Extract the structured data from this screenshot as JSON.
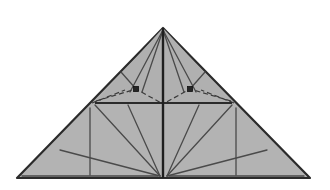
{
  "figure": {
    "type": "origami-crease-pattern",
    "canvas": {
      "width": 330,
      "height": 190,
      "background": "#ffffff"
    },
    "colors": {
      "paper_fill": "#b3b3b3",
      "paper_fill_upper": "#b0b0b0",
      "outline": "#2b2b2b",
      "crease_solid": "#4a4a4a",
      "crease_dashed": "#3a3a3a",
      "spine": "#1f1f1f",
      "marker_fill": "#262626",
      "marker_stroke": "#111111"
    },
    "stroke_widths": {
      "outline": 2.2,
      "spine": 2.4,
      "crease_solid": 1.3,
      "crease_heavy": 1.9,
      "crease_dashed": 1.2
    },
    "dash_pattern": "5,3"
  },
  "vertices": {
    "apex": {
      "x": 163,
      "y": 28,
      "label": "apex"
    },
    "bottom_left": {
      "x": 17,
      "y": 178,
      "label": "bottom-left-corner"
    },
    "bottom_right": {
      "x": 310,
      "y": 178,
      "label": "bottom-right-corner"
    },
    "center_bottom": {
      "x": 163,
      "y": 178,
      "label": "center-bottom"
    },
    "band_left": {
      "x": 95,
      "y": 103,
      "label": "horizontal-band-left-end"
    },
    "band_right": {
      "x": 232,
      "y": 103,
      "label": "horizontal-band-right-end"
    },
    "marker_left": {
      "x": 136,
      "y": 89,
      "label": "left-pleat-node"
    },
    "marker_right": {
      "x": 190,
      "y": 89,
      "label": "right-pleat-node"
    },
    "left_vertical_top": {
      "x": 90,
      "y": 108,
      "label": "left-vertical-crease-top"
    },
    "left_vertical_bottom": {
      "x": 90,
      "y": 175,
      "label": "left-vertical-crease-bottom"
    },
    "right_vertical_top": {
      "x": 236,
      "y": 108,
      "label": "right-vertical-crease-top"
    },
    "right_vertical_bottom": {
      "x": 236,
      "y": 175,
      "label": "right-vertical-crease-bottom"
    }
  },
  "shapes": {
    "paper_outline": "17,178 163,28 310,178",
    "upper_left_panel": "163,28 95,103 163,103",
    "upper_right_panel": "163,28 232,103 163,103"
  },
  "creases": {
    "spine": {
      "name": "center-vertical-spine",
      "d": "M 163,28 L 163,178",
      "style": "heavy-solid"
    },
    "horizontal_band": {
      "name": "horizontal-fold-band",
      "d": "M 95,103 L 232,103",
      "style": "heavy-solid"
    },
    "apex_rays": [
      {
        "name": "apex-ray-left-outer",
        "d": "M 163,30 L 130,92"
      },
      {
        "name": "apex-ray-left-inner",
        "d": "M 163,30 L 142,92"
      },
      {
        "name": "apex-ray-right-inner",
        "d": "M 163,30 L 184,92"
      },
      {
        "name": "apex-ray-right-outer",
        "d": "M 163,30 L 196,92"
      }
    ],
    "dashed_arcs": [
      {
        "name": "dashed-arc-left",
        "d": "M 96,101 L 136,89 L 163,104"
      },
      {
        "name": "dashed-arc-right",
        "d": "M 231,101 L 190,89 L 163,104"
      },
      {
        "name": "dashed-sweep-left",
        "d": "M 92,103 L 125,90"
      },
      {
        "name": "dashed-sweep-right",
        "d": "M 234,103 L 201,90"
      }
    ],
    "corner_creases": [
      {
        "name": "upper-left-corner-crease",
        "d": "M 121,72 L 136,89"
      },
      {
        "name": "upper-right-corner-crease",
        "d": "M 205,72 L 190,89"
      }
    ],
    "lower_left_fan": [
      {
        "name": "fan-left-ray-1",
        "d": "M 160,176 L 95,105"
      },
      {
        "name": "fan-left-ray-2",
        "d": "M 160,176 L 128,105"
      },
      {
        "name": "fan-left-ray-3",
        "d": "M 160,176 L 60,150"
      },
      {
        "name": "fan-left-ray-4",
        "d": "M 158,176 L 22,176"
      }
    ],
    "lower_right_fan": [
      {
        "name": "fan-right-ray-1",
        "d": "M 167,176 L 232,105"
      },
      {
        "name": "fan-right-ray-2",
        "d": "M 167,176 L 199,105"
      },
      {
        "name": "fan-right-ray-3",
        "d": "M 167,176 L 267,150"
      },
      {
        "name": "fan-right-ray-4",
        "d": "M 169,176 L 304,176"
      }
    ],
    "lower_verticals": [
      {
        "name": "left-vertical-crease",
        "d": "M 90,108 L 90,175"
      },
      {
        "name": "right-vertical-crease",
        "d": "M 236,108 L 236,175"
      }
    ]
  },
  "markers": [
    {
      "name": "left-pleat-node",
      "x": 136,
      "y": 89,
      "size": 5,
      "shape": "square"
    },
    {
      "name": "right-pleat-node",
      "x": 190,
      "y": 89,
      "size": 5,
      "shape": "square"
    }
  ]
}
